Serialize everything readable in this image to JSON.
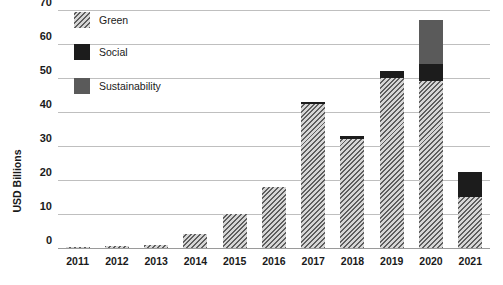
{
  "chart_data": {
    "type": "bar",
    "title": "",
    "subtitle": "",
    "xlabel": "",
    "ylabel": "USD Billions",
    "ylim": [
      0,
      70
    ],
    "yticks": [
      0,
      10,
      20,
      30,
      40,
      50,
      60,
      70
    ],
    "grid": true,
    "stacked": true,
    "legend_position": "top-left-inside",
    "categories": [
      "2011",
      "2012",
      "2013",
      "2014",
      "2015",
      "2016",
      "2017",
      "2018",
      "2019",
      "2020",
      "2021"
    ],
    "series": [
      {
        "name": "Green",
        "color": "#9d9d9d",
        "pattern": "diagonal-hatch",
        "values": [
          0.3,
          0.5,
          1.0,
          4.0,
          10.0,
          18.0,
          42.5,
          32.0,
          50.0,
          49.0,
          15.0
        ]
      },
      {
        "name": "Social",
        "color": "#1c1c1c",
        "pattern": "solid",
        "values": [
          0,
          0,
          0,
          0,
          0,
          0,
          0.5,
          1.0,
          2.0,
          5.0,
          7.5
        ]
      },
      {
        "name": "Sustainability",
        "color": "#5a5a5a",
        "pattern": "solid",
        "values": [
          0,
          0,
          0,
          0,
          0,
          0,
          0,
          0,
          0,
          13.0,
          0
        ]
      }
    ],
    "totals": [
      0.3,
      0.5,
      1.0,
      4.0,
      10.0,
      18.0,
      43.0,
      33.0,
      52.0,
      67.0,
      22.5
    ]
  },
  "legend": {
    "items": [
      {
        "label": "Green",
        "swatch": "green-hatch-swatch"
      },
      {
        "label": "Social",
        "swatch": "social-solid-swatch"
      },
      {
        "label": "Sustainability",
        "swatch": "sustainability-solid-swatch"
      }
    ]
  },
  "colors": {
    "green": "#9d9d9d",
    "social": "#1c1c1c",
    "sustainability": "#5a5a5a",
    "gridline": "#bfbfbf",
    "axis_text": "#1a1a1a",
    "background": "#ffffff"
  }
}
